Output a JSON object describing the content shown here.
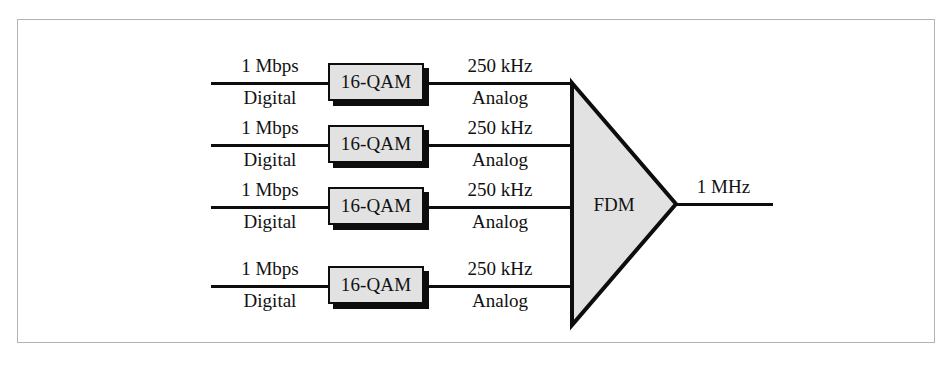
{
  "figure": {
    "colors": {
      "frame_border": "#b3b3b3",
      "line": "#0d0d0d",
      "box_fill": "#e2e2e2",
      "box_border": "#0d0d0d",
      "box_shadow": "#0d0d0d",
      "triangle_fill": "#e2e2e2",
      "triangle_stroke": "#0d0d0d",
      "background": "#ffffff",
      "text": "#111111"
    }
  },
  "channels": [
    {
      "input_rate": "1 Mbps",
      "input_type": "Digital",
      "modulator": "16-QAM",
      "output_rate": "250 kHz",
      "output_type": "Analog"
    },
    {
      "input_rate": "1 Mbps",
      "input_type": "Digital",
      "modulator": "16-QAM",
      "output_rate": "250 kHz",
      "output_type": "Analog"
    },
    {
      "input_rate": "1 Mbps",
      "input_type": "Digital",
      "modulator": "16-QAM",
      "output_rate": "250 kHz",
      "output_type": "Analog"
    },
    {
      "input_rate": "1 Mbps",
      "input_type": "Digital",
      "modulator": "16-QAM",
      "output_rate": "250 kHz",
      "output_type": "Analog"
    }
  ],
  "multiplexer": {
    "label": "FDM"
  },
  "output": {
    "label": "1 MHz"
  }
}
